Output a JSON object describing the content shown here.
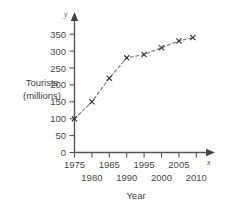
{
  "chart_data": {
    "type": "line",
    "title": "",
    "xlabel": "Year",
    "ylabel_line1": "Tourists",
    "ylabel_line2": "(millions)",
    "x": [
      1975,
      1980,
      1985,
      1990,
      1995,
      2000,
      2005,
      2009
    ],
    "values": [
      100,
      150,
      220,
      280,
      290,
      310,
      330,
      340
    ],
    "series": [
      {
        "name": "International tourist arrivals",
        "values": [
          100,
          150,
          220,
          280,
          290,
          310,
          330,
          340
        ]
      }
    ],
    "xlim": [
      1975,
      2013
    ],
    "ylim": [
      0,
      370
    ],
    "x_major_ticks": [
      1975,
      1980,
      1985,
      1990,
      1995,
      2000,
      2005,
      2010
    ],
    "x_tick_labels_upper": [
      "1975",
      "1985",
      "1995",
      "2005"
    ],
    "x_tick_labels_lower": [
      "1980",
      "1990",
      "2000",
      "2010"
    ],
    "y_ticks": [
      0,
      50,
      100,
      150,
      200,
      250,
      300,
      350
    ],
    "y_tick_labels": [
      "0",
      "50",
      "100",
      "150",
      "200",
      "250",
      "300",
      "350"
    ],
    "grid": false,
    "legend": "none",
    "marker": "x-cross",
    "line_style": "dashed",
    "axis_letter_x": "x",
    "axis_letter_y": "y",
    "colors": {
      "background": "#ffffff",
      "axis": "#555555",
      "line": "#777777",
      "marker": "#333333",
      "text": "#444444"
    }
  }
}
